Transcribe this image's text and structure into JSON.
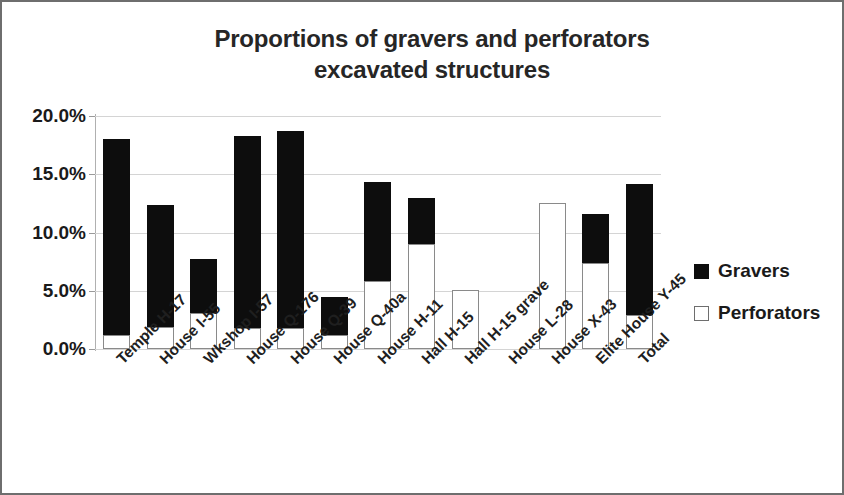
{
  "chart_data": {
    "type": "bar",
    "subtype": "stacked-column",
    "title": "Proportions of gravers and perforators excavated structures",
    "title_lines": [
      "Proportions of gravers and perforators",
      "excavated structures"
    ],
    "xlabel": "",
    "ylabel": "",
    "ylim": [
      0,
      20
    ],
    "yticks": [
      0,
      5,
      10,
      15,
      20
    ],
    "ytick_labels": [
      "0.0%",
      "5.0%",
      "10.0%",
      "15.0%",
      "20.0%"
    ],
    "grid": true,
    "grid_axis": "y",
    "legend_position": "right",
    "categories": [
      "Temple H-17",
      "House I-55",
      "Wkshop I-57",
      "House Q-176",
      "House Q-39",
      "House Q-40a",
      "House H-11",
      "Hall H-15",
      "Hall H-15 grave",
      "House L-28",
      "House X-43",
      "Elite House Y-45",
      "Total"
    ],
    "series": [
      {
        "name": "Gravers",
        "color": "#0d0d0d",
        "values": [
          16.8,
          10.5,
          4.6,
          16.5,
          16.9,
          3.3,
          8.5,
          4.0,
          0.0,
          0.0,
          0.0,
          4.2,
          11.3
        ]
      },
      {
        "name": "Perforators",
        "color": "#ffffff",
        "values": [
          1.2,
          1.9,
          3.1,
          1.8,
          1.8,
          1.2,
          5.8,
          9.0,
          5.1,
          0.0,
          12.5,
          7.4,
          2.9
        ]
      }
    ],
    "totals": [
      18.0,
      12.4,
      7.7,
      18.3,
      18.7,
      4.5,
      14.3,
      13.0,
      5.1,
      0.0,
      12.5,
      11.6,
      14.2
    ]
  }
}
